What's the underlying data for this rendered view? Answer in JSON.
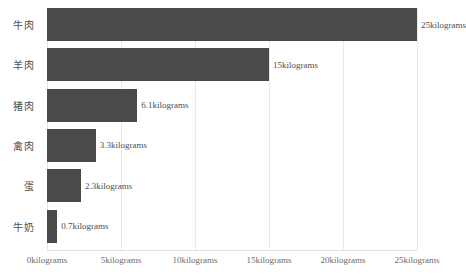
{
  "chart_data": {
    "type": "bar",
    "orientation": "horizontal",
    "title": "",
    "subtitle": "",
    "xlabel": "",
    "ylabel": "",
    "categories": [
      "牛肉",
      "羊肉",
      "猪肉",
      "禽肉",
      "蛋",
      "牛奶"
    ],
    "values": [
      25,
      15,
      6.1,
      3.3,
      2.3,
      0.7
    ],
    "value_labels": [
      "25kilograms",
      "15kilograms",
      "6.1kilograms",
      "3.3kilograms",
      "2.3kilograms",
      "0.7kilograms"
    ],
    "unit": "kilograms",
    "xlim": [
      0,
      25
    ],
    "xticks": [
      0,
      5,
      10,
      15,
      20,
      25
    ],
    "xtick_labels": [
      "0kilograms",
      "5kilograms",
      "10kilograms",
      "15kilograms",
      "20kilograms",
      "25kilograms"
    ],
    "grid": true,
    "grid_axis": "x",
    "legend": false,
    "legend_position": "none",
    "bar_color": "#4a4a4a",
    "grid_color": "#e9e9e9",
    "text_color": "#4d4d4d",
    "background": "#ffffff"
  }
}
